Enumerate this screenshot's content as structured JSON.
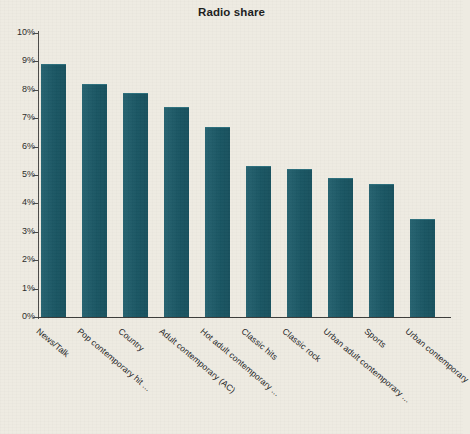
{
  "chart_data": {
    "type": "bar",
    "title": "Radio share",
    "xlabel": "",
    "ylabel": "",
    "ylim": [
      0,
      10
    ],
    "ytick_labels": [
      "10%",
      "9%",
      "8%",
      "7%",
      "6%",
      "5%",
      "4%",
      "3%",
      "2%",
      "1%",
      "0%"
    ],
    "ytick_values": [
      10,
      9,
      8,
      7,
      6,
      5,
      4,
      3,
      2,
      1,
      0
    ],
    "grid": false,
    "legend": "none",
    "units": "percent",
    "bar_color": "#1a5a68",
    "background_color": "#eeebe2",
    "categories": [
      "News/Talk",
      "Pop contemporary hit ...",
      "Country",
      "Adult contemporary (AC)",
      "Hot adult contemporary ...",
      "Classic hits",
      "Classic rock",
      "Urban adult contemporary ...",
      "Sports",
      "Urban contemporary"
    ],
    "values": [
      8.9,
      8.2,
      7.9,
      7.4,
      6.7,
      5.3,
      5.2,
      4.9,
      4.7,
      3.45
    ]
  }
}
